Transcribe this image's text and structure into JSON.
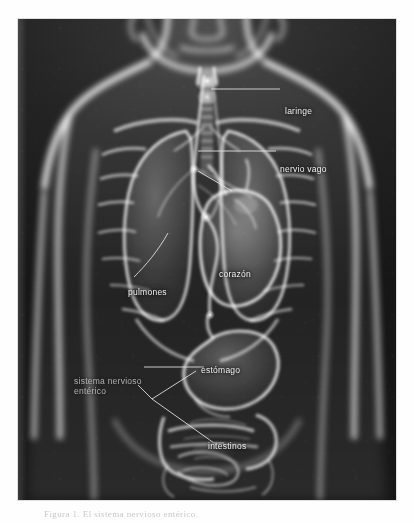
{
  "page": {
    "background_color": "#fefefe",
    "caption": "Figura 1. El sistema nervioso entérico."
  },
  "figure": {
    "name": "anatomia-torso-rayos-x",
    "background_color": "#1c1c1c",
    "organ_glow_color": "#ffffff",
    "label_color": "#f2f2f2",
    "leader_line_color": "#e6e6e6",
    "labels": [
      {
        "id": "laringe",
        "text": "laringe",
        "x": 285,
        "y": 92,
        "style": "bright"
      },
      {
        "id": "nervio-vago",
        "text": "nervio vago",
        "x": 280,
        "y": 150,
        "style": "bright"
      },
      {
        "id": "corazon",
        "text": "corazón",
        "x": 219,
        "y": 255,
        "style": "bright"
      },
      {
        "id": "pulmones",
        "text": "pulmones",
        "x": 128,
        "y": 273,
        "style": "bright"
      },
      {
        "id": "estomago",
        "text": "estómago",
        "x": 201,
        "y": 351,
        "style": "bright"
      },
      {
        "id": "sistema-nervioso-enterico-linea1",
        "text": "sistema nervioso",
        "x": 74,
        "y": 362,
        "style": "dim"
      },
      {
        "id": "sistema-nervioso-enterico-linea2",
        "text": "entérico",
        "x": 74,
        "y": 372,
        "style": "dim"
      },
      {
        "id": "intestinos",
        "text": "intestinos",
        "x": 208,
        "y": 427,
        "style": "bright"
      }
    ],
    "organs": [
      {
        "id": "laringe",
        "label": "laringe"
      },
      {
        "id": "traquea",
        "label": "tráquea"
      },
      {
        "id": "pulmon-derecho",
        "label": "pulmón derecho"
      },
      {
        "id": "pulmon-izquierdo",
        "label": "pulmón izquierdo"
      },
      {
        "id": "corazon",
        "label": "corazón"
      },
      {
        "id": "nervio-vago",
        "label": "nervio vago"
      },
      {
        "id": "esofago",
        "label": "esófago"
      },
      {
        "id": "estomago",
        "label": "estómago"
      },
      {
        "id": "intestino-grueso",
        "label": "intestino grueso"
      },
      {
        "id": "intestino-delgado",
        "label": "intestino delgado"
      },
      {
        "id": "costillas",
        "label": "caja torácica"
      },
      {
        "id": "clavicula",
        "label": "clavícula"
      },
      {
        "id": "columna",
        "label": "columna vertebral"
      }
    ]
  }
}
